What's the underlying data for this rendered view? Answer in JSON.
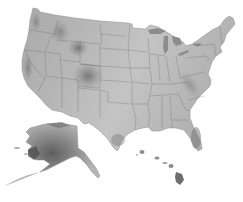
{
  "map": {
    "type": "shaded-relief",
    "subject": "United States",
    "color_scheme": "grayscale",
    "background": "#ffffff",
    "land_light": "#cfcfcf",
    "land_mid": "#a8a8a8",
    "land_dark": "#6e6e6e",
    "regions": [
      {
        "name": "Contiguous United States",
        "has_state_borders": true
      },
      {
        "name": "Alaska",
        "inset": true
      },
      {
        "name": "Hawaii",
        "inset": true
      }
    ],
    "labels": []
  }
}
